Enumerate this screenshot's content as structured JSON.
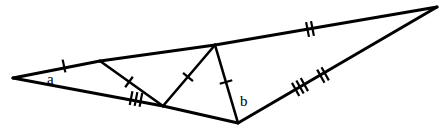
{
  "figure": {
    "type": "geometry-diagram",
    "width": 448,
    "height": 130,
    "background_color": "#ffffff",
    "stroke_color": "#000000"
  },
  "labels": {
    "angle_a": "a",
    "angle_b": "b"
  },
  "points": {
    "A": {
      "name": "left-apex",
      "x": 13,
      "y": 78
    },
    "B": {
      "name": "top-right-apex",
      "x": 437,
      "y": 7
    },
    "C": {
      "name": "bottom-apex",
      "x": 238,
      "y": 123
    },
    "D": {
      "name": "top-edge-point-d",
      "x": 100,
      "y": 61
    },
    "E": {
      "name": "bottom-edge-point-e",
      "x": 163,
      "y": 106
    },
    "F": {
      "name": "top-edge-point-f",
      "x": 215,
      "y": 45
    }
  },
  "segments": [
    {
      "name": "edge-a-to-d",
      "from": "A",
      "to": "D",
      "ticks": 1,
      "class": "edge"
    },
    {
      "name": "edge-d-to-f",
      "from": "D",
      "to": "F",
      "ticks": 0,
      "class": "edge"
    },
    {
      "name": "edge-f-to-b",
      "from": "F",
      "to": "B",
      "ticks": 2,
      "class": "edge"
    },
    {
      "name": "edge-b-to-c",
      "from": "B",
      "to": "C",
      "ticks": 0,
      "class": "edge"
    },
    {
      "name": "edge-a-to-e",
      "from": "A",
      "to": "E",
      "ticks": 3,
      "class": "edge"
    },
    {
      "name": "edge-e-to-c",
      "from": "E",
      "to": "C",
      "ticks": 0,
      "class": "edge"
    },
    {
      "name": "cevian-d-to-e",
      "from": "D",
      "to": "E",
      "ticks": 1,
      "class": "cevian"
    },
    {
      "name": "cevian-e-to-f",
      "from": "E",
      "to": "F",
      "ticks": 1,
      "class": "cevian"
    },
    {
      "name": "cevian-f-to-c",
      "from": "F",
      "to": "C",
      "ticks": 1,
      "class": "cevian"
    }
  ],
  "tick_marks": [
    {
      "name": "tick-single-top-left",
      "x": 64,
      "y": 66,
      "count": 1,
      "angle": 348,
      "length": 13
    },
    {
      "name": "tick-double-top-right",
      "x": 310,
      "y": 29,
      "count": 2,
      "angle": 349,
      "length": 15
    },
    {
      "name": "tick-triple-bottom-left",
      "x": 136,
      "y": 99,
      "count": 3,
      "angle": 11,
      "length": 14
    },
    {
      "name": "tick-triple-bottom-right",
      "x": 300,
      "y": 87,
      "count": 3,
      "angle": 331,
      "length": 15
    },
    {
      "name": "tick-double-bottom-right",
      "x": 323,
      "y": 75,
      "count": 2,
      "angle": 331,
      "length": 15
    },
    {
      "name": "tick-single-cevian-de",
      "x": 129,
      "y": 82,
      "count": 1,
      "angle": 36,
      "length": 13
    },
    {
      "name": "tick-single-cevian-ef",
      "x": 188,
      "y": 77,
      "count": 1,
      "angle": 310,
      "length": 13
    },
    {
      "name": "tick-single-cevian-fc",
      "x": 226,
      "y": 82,
      "count": 1,
      "angle": 74,
      "length": 13
    }
  ],
  "label_positions": {
    "angle_a": {
      "x": 47,
      "y": 84
    },
    "angle_b": {
      "x": 240,
      "y": 106
    }
  }
}
